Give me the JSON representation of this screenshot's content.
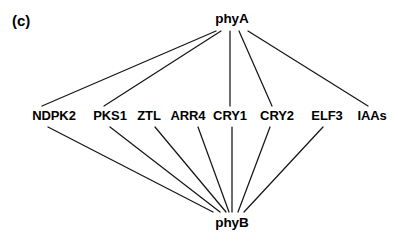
{
  "figure": {
    "panel_label": "(c)",
    "width": 398,
    "height": 244,
    "background_color": "#ffffff",
    "edge_color": "#161616",
    "text_color": "#000000"
  },
  "chart_data": {
    "type": "diagram",
    "diagram_type": "bipartite-interaction-network",
    "title": "(c)",
    "nodes": [
      {
        "id": "phyA",
        "label": "phyA",
        "row": "top",
        "x": 232,
        "y": 19
      },
      {
        "id": "NDPK2",
        "label": "NDPK2",
        "row": "middle",
        "x": 54,
        "y": 116
      },
      {
        "id": "PKS1",
        "label": "PKS1",
        "row": "middle",
        "x": 110,
        "y": 116
      },
      {
        "id": "ZTL",
        "label": "ZTL",
        "row": "middle",
        "x": 149,
        "y": 116
      },
      {
        "id": "ARR4",
        "label": "ARR4",
        "row": "middle",
        "x": 188,
        "y": 116
      },
      {
        "id": "CRY1",
        "label": "CRY1",
        "row": "middle",
        "x": 230,
        "y": 116
      },
      {
        "id": "CRY2",
        "label": "CRY2",
        "row": "middle",
        "x": 277,
        "y": 116
      },
      {
        "id": "ELF3",
        "label": "ELF3",
        "row": "middle",
        "x": 327,
        "y": 116
      },
      {
        "id": "IAAs",
        "label": "IAAs",
        "row": "middle",
        "x": 372,
        "y": 116
      },
      {
        "id": "phyB",
        "label": "phyB",
        "row": "bottom",
        "x": 232,
        "y": 223
      }
    ],
    "edges": [
      {
        "source": "phyA",
        "target": "NDPK2"
      },
      {
        "source": "phyA",
        "target": "PKS1"
      },
      {
        "source": "phyA",
        "target": "CRY1"
      },
      {
        "source": "phyA",
        "target": "CRY2"
      },
      {
        "source": "phyA",
        "target": "IAAs"
      },
      {
        "source": "phyB",
        "target": "NDPK2"
      },
      {
        "source": "phyB",
        "target": "PKS1"
      },
      {
        "source": "phyB",
        "target": "ZTL"
      },
      {
        "source": "phyB",
        "target": "ARR4"
      },
      {
        "source": "phyB",
        "target": "CRY1"
      },
      {
        "source": "phyB",
        "target": "CRY2"
      },
      {
        "source": "phyB",
        "target": "ELF3"
      }
    ],
    "edge_geometry": [
      {
        "name": "phyA-NDPK2",
        "x1": 216,
        "y1": 31,
        "x2": 42,
        "y2": 106
      },
      {
        "name": "phyA-PKS1",
        "x1": 221,
        "y1": 31,
        "x2": 104,
        "y2": 106
      },
      {
        "name": "phyA-CRY1",
        "x1": 230,
        "y1": 31,
        "x2": 230,
        "y2": 106
      },
      {
        "name": "phyA-CRY2",
        "x1": 239,
        "y1": 31,
        "x2": 272,
        "y2": 106
      },
      {
        "name": "phyA-IAAs",
        "x1": 248,
        "y1": 31,
        "x2": 368,
        "y2": 106
      },
      {
        "name": "NDPK2-phyB",
        "x1": 48,
        "y1": 127,
        "x2": 213,
        "y2": 212
      },
      {
        "name": "PKS1-phyB",
        "x1": 110,
        "y1": 127,
        "x2": 220,
        "y2": 212
      },
      {
        "name": "ZTL-phyB",
        "x1": 155,
        "y1": 127,
        "x2": 226,
        "y2": 212
      },
      {
        "name": "ARR4-phyB",
        "x1": 198,
        "y1": 127,
        "x2": 229,
        "y2": 212
      },
      {
        "name": "CRY1-phyB",
        "x1": 232,
        "y1": 127,
        "x2": 232,
        "y2": 212
      },
      {
        "name": "CRY2-phyB",
        "x1": 270,
        "y1": 127,
        "x2": 238,
        "y2": 212
      },
      {
        "name": "ELF3-phyB",
        "x1": 323,
        "y1": 127,
        "x2": 244,
        "y2": 212
      }
    ]
  }
}
